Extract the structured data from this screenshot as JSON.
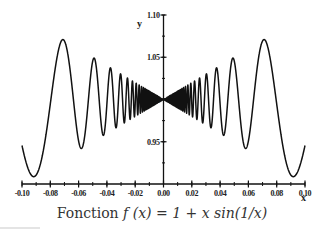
{
  "chart_data": {
    "type": "line",
    "title": "",
    "caption": "Fonction f (x) = 1 + x sin(1/x)",
    "caption_prefix": "Fonction",
    "caption_formula": "f (x) = 1 + x sin(1/x)",
    "function": "1 + x*sin(1/x)",
    "xlabel": "x",
    "ylabel": "y",
    "xlim": [
      -0.1,
      0.1
    ],
    "ylim": [
      0.9,
      1.1
    ],
    "x_ticks": [
      -0.1,
      -0.08,
      -0.06,
      -0.04,
      -0.02,
      0.0,
      0.02,
      0.04,
      0.06,
      0.08,
      0.1
    ],
    "x_tick_labels": [
      "-0.10",
      "-0.08",
      "-0.06",
      "-0.04",
      "-0.02",
      "0.00",
      "0.02",
      "0.04",
      "0.06",
      "0.08",
      "0.10"
    ],
    "x_minor_step": 0.01,
    "y_ticks": [
      1.1,
      1.05,
      1.0,
      0.95
    ],
    "y_tick_labels": [
      "1.10",
      "1.05",
      "1.00",
      "0.95"
    ],
    "y_minor_step": 0.025,
    "grid": false,
    "legend": null,
    "series": [
      {
        "name": "f(x) = 1 + x sin(1/x)",
        "color": "#111111",
        "sample_points": [
          {
            "x": -0.1,
            "y": 0.9456
          },
          {
            "x": -0.092,
            "y": 0.908
          },
          {
            "x": -0.072,
            "y": 1.071
          },
          {
            "x": -0.058,
            "y": 0.943
          },
          {
            "x": -0.049,
            "y": 1.044
          },
          {
            "x": -0.042,
            "y": 0.96
          },
          {
            "x": -0.037,
            "y": 1.035
          },
          {
            "x": -0.033,
            "y": 0.968
          },
          {
            "x": 0.0,
            "y": 1.0
          },
          {
            "x": 0.033,
            "y": 0.968
          },
          {
            "x": 0.037,
            "y": 1.035
          },
          {
            "x": 0.042,
            "y": 0.96
          },
          {
            "x": 0.049,
            "y": 1.044
          },
          {
            "x": 0.058,
            "y": 0.943
          },
          {
            "x": 0.072,
            "y": 1.071
          },
          {
            "x": 0.092,
            "y": 0.908
          },
          {
            "x": 0.1,
            "y": 0.9456
          }
        ]
      }
    ]
  },
  "layout": {
    "plot_left_px": 22,
    "plot_right_px": 305,
    "axis_y_px": 184,
    "y_top_px": 15,
    "origin_x_px": 163
  }
}
